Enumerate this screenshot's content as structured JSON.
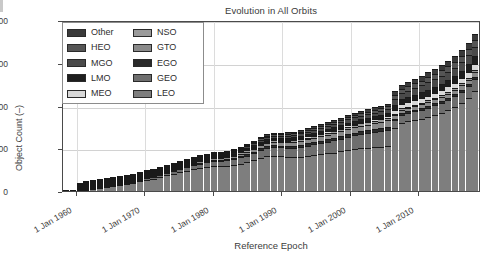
{
  "chart_data": {
    "type": "bar",
    "stacked": true,
    "title": "Evolution in All Orbits",
    "xlabel": "Reference Epoch",
    "ylabel": "Object Count (–)",
    "ylim": [
      0,
      20000
    ],
    "ytick_labels": [
      "0",
      "5000",
      "10000",
      "15000",
      "20000"
    ],
    "ytick_values": [
      0,
      5000,
      10000,
      15000,
      20000
    ],
    "xtick_labels": [
      "1 Jan 1960",
      "1 Jan 1970",
      "1 Jan 1980",
      "1 Jan 1990",
      "1 Jan 2000",
      "1 Jan 2010"
    ],
    "xtick_values": [
      1960,
      1970,
      1980,
      1990,
      2000,
      2010
    ],
    "xlim": [
      1958,
      2019
    ],
    "grid": true,
    "legend_position": "upper left",
    "legend_entries": [
      "Other",
      "HEO",
      "MGO",
      "LMO",
      "MEO",
      "NSO",
      "GTO",
      "EGO",
      "GEO",
      "LEO"
    ],
    "colors": {
      "Other": "#3a3a3a",
      "HEO": "#555555",
      "MGO": "#4a4a4a",
      "LMO": "#1e1e1e",
      "MEO": "#d8d8d8",
      "NSO": "#9a9a9a",
      "GTO": "#8a8a8a",
      "EGO": "#2a2a2a",
      "GEO": "#6e6e6e",
      "LEO": "#7e7e7e"
    },
    "categories": [
      1958,
      1959,
      1960,
      1961,
      1962,
      1963,
      1964,
      1965,
      1966,
      1967,
      1968,
      1969,
      1970,
      1971,
      1972,
      1973,
      1974,
      1975,
      1976,
      1977,
      1978,
      1979,
      1980,
      1981,
      1982,
      1983,
      1984,
      1985,
      1986,
      1987,
      1988,
      1989,
      1990,
      1991,
      1992,
      1993,
      1994,
      1995,
      1996,
      1997,
      1998,
      1999,
      2000,
      2001,
      2002,
      2003,
      2004,
      2005,
      2006,
      2007,
      2008,
      2009,
      2010,
      2011,
      2012,
      2013,
      2014,
      2015,
      2016,
      2017,
      2018,
      2019
    ],
    "series": [
      {
        "name": "LEO",
        "values": [
          5,
          20,
          60,
          130,
          230,
          330,
          430,
          560,
          700,
          840,
          980,
          1130,
          1290,
          1460,
          1650,
          1830,
          2000,
          2180,
          2380,
          2560,
          2720,
          2830,
          2950,
          2900,
          2950,
          3050,
          3200,
          3350,
          3600,
          3900,
          4100,
          4150,
          4050,
          3980,
          3950,
          4020,
          4100,
          4200,
          4300,
          4400,
          4500,
          4650,
          4800,
          4900,
          5000,
          5050,
          5120,
          5200,
          5300,
          7400,
          8000,
          8150,
          8300,
          8450,
          8650,
          8900,
          9150,
          9450,
          9800,
          10300,
          10900,
          11700
        ]
      },
      {
        "name": "GEO",
        "values": [
          0,
          0,
          5,
          10,
          20,
          30,
          45,
          60,
          80,
          100,
          125,
          150,
          180,
          210,
          245,
          280,
          315,
          350,
          390,
          430,
          470,
          510,
          560,
          600,
          640,
          690,
          740,
          790,
          840,
          900,
          950,
          1000,
          1040,
          1080,
          1120,
          1170,
          1220,
          1270,
          1320,
          1380,
          1430,
          1480,
          1540,
          1600,
          1650,
          1700,
          1750,
          1800,
          1850,
          900,
          940,
          980,
          1020,
          1060,
          1100,
          1140,
          1180,
          1220,
          1260,
          1300,
          1340,
          1390
        ]
      },
      {
        "name": "EGO",
        "values": [
          0,
          0,
          0,
          2,
          4,
          6,
          9,
          12,
          16,
          20,
          25,
          30,
          36,
          42,
          49,
          56,
          63,
          70,
          78,
          86,
          94,
          102,
          112,
          120,
          128,
          138,
          148,
          158,
          168,
          180,
          190,
          200,
          208,
          216,
          224,
          234,
          244,
          254,
          264,
          276,
          286,
          296,
          308,
          320,
          330,
          340,
          350,
          360,
          370,
          180,
          188,
          196,
          204,
          212,
          220,
          228,
          236,
          244,
          252,
          260,
          268,
          278
        ]
      },
      {
        "name": "GTO",
        "values": [
          0,
          0,
          2,
          5,
          9,
          14,
          19,
          25,
          32,
          40,
          50,
          60,
          72,
          84,
          98,
          112,
          126,
          140,
          156,
          172,
          188,
          204,
          224,
          240,
          256,
          276,
          296,
          316,
          336,
          360,
          380,
          400,
          416,
          432,
          448,
          468,
          488,
          508,
          528,
          552,
          572,
          592,
          616,
          640,
          660,
          680,
          700,
          720,
          740,
          360,
          376,
          392,
          408,
          424,
          440,
          456,
          472,
          488,
          504,
          520,
          536,
          556
        ]
      },
      {
        "name": "NSO",
        "values": [
          0,
          0,
          1,
          2,
          4,
          6,
          8,
          11,
          14,
          18,
          22,
          26,
          31,
          36,
          42,
          48,
          54,
          60,
          67,
          74,
          81,
          88,
          96,
          103,
          110,
          118,
          127,
          135,
          144,
          154,
          163,
          171,
          178,
          185,
          192,
          200,
          209,
          218,
          226,
          236,
          245,
          254,
          264,
          274,
          283,
          291,
          300,
          309,
          317,
          154,
          161,
          168,
          175,
          182,
          189,
          195,
          202,
          209,
          216,
          223,
          230,
          238
        ]
      },
      {
        "name": "MEO",
        "values": [
          0,
          0,
          0,
          1,
          2,
          3,
          5,
          6,
          8,
          10,
          12,
          15,
          18,
          21,
          24,
          28,
          32,
          35,
          39,
          43,
          47,
          51,
          56,
          60,
          64,
          69,
          74,
          79,
          84,
          90,
          95,
          100,
          104,
          108,
          112,
          117,
          122,
          127,
          132,
          138,
          143,
          148,
          154,
          160,
          165,
          170,
          175,
          180,
          185,
          460,
          480,
          500,
          520,
          540,
          560,
          580,
          600,
          620,
          640,
          660,
          680,
          710
        ]
      },
      {
        "name": "LMO",
        "values": [
          0,
          0,
          1,
          2,
          4,
          6,
          9,
          12,
          16,
          20,
          25,
          30,
          36,
          42,
          49,
          56,
          63,
          70,
          78,
          86,
          94,
          102,
          112,
          120,
          128,
          138,
          148,
          158,
          168,
          180,
          190,
          200,
          208,
          216,
          224,
          234,
          244,
          254,
          264,
          276,
          286,
          296,
          308,
          320,
          330,
          340,
          350,
          360,
          370,
          560,
          585,
          610,
          635,
          660,
          685,
          710,
          735,
          760,
          790,
          820,
          855,
          895
        ]
      },
      {
        "name": "MGO",
        "values": [
          0,
          0,
          1,
          3,
          5,
          8,
          11,
          15,
          20,
          25,
          31,
          37,
          45,
          52,
          61,
          70,
          79,
          88,
          98,
          108,
          118,
          128,
          140,
          150,
          160,
          172,
          185,
          197,
          210,
          225,
          238,
          250,
          260,
          270,
          280,
          292,
          305,
          318,
          330,
          345,
          358,
          370,
          385,
          400,
          412,
          425,
          438,
          450,
          462,
          700,
          730,
          762,
          794,
          825,
          856,
          888,
          919,
          950,
          988,
          1025,
          1069,
          1119
        ]
      },
      {
        "name": "HEO",
        "values": [
          0,
          0,
          1,
          2,
          4,
          6,
          8,
          11,
          14,
          18,
          22,
          26,
          31,
          36,
          42,
          48,
          54,
          60,
          67,
          74,
          81,
          88,
          96,
          103,
          110,
          118,
          127,
          135,
          144,
          154,
          163,
          171,
          178,
          185,
          192,
          200,
          209,
          218,
          226,
          236,
          245,
          254,
          264,
          274,
          283,
          291,
          300,
          309,
          317,
          480,
          501,
          522,
          544,
          565,
          586,
          608,
          629,
          650,
          677,
          702,
          732,
          766
        ]
      },
      {
        "name": "Other",
        "values": [
          0,
          0,
          1,
          2,
          4,
          6,
          8,
          11,
          14,
          18,
          22,
          26,
          31,
          36,
          42,
          48,
          54,
          60,
          67,
          74,
          81,
          88,
          96,
          103,
          110,
          118,
          127,
          135,
          144,
          154,
          163,
          171,
          178,
          185,
          192,
          200,
          209,
          218,
          226,
          236,
          245,
          254,
          264,
          274,
          283,
          291,
          300,
          309,
          317,
          480,
          501,
          522,
          544,
          565,
          586,
          608,
          629,
          650,
          677,
          702,
          732,
          766
        ]
      }
    ],
    "totals": [
      5,
      20,
      72,
      159,
      286,
      415,
      552,
      723,
      904,
      1109,
      1294,
      1504,
      1770,
      2039,
      2362,
      2676,
      2990,
      3313,
      3650,
      4037,
      4374,
      4651,
      4950,
      4996,
      5156,
      5387,
      5672,
      5943,
      6338,
      6797,
      7132,
      7269,
      7220,
      7150,
      7144,
      7335,
      7561,
      7787,
      8020,
      8275,
      8510,
      8794,
      9103,
      9362,
      9576,
      9778,
      9983,
      10198,
      10428,
      11704,
      12482,
      12802,
      13144,
      13483,
      13772,
      14113,
      14452,
      14791,
      15204,
      15712,
      16440,
      17618
    ]
  }
}
